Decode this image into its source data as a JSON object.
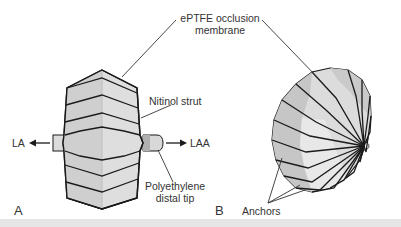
{
  "figure": {
    "panels": [
      {
        "letter": "A",
        "description": "Side view of occlusion device"
      },
      {
        "letter": "B",
        "description": "Oblique view of occlusion device"
      }
    ],
    "labels": {
      "membrane_line1": "ePTFE occlusion",
      "membrane_line2": "membrane",
      "nitinol": "Nitinol strut",
      "tip_line1": "Polyethylene",
      "tip_line2": "distal tip",
      "la": "LA",
      "laa": "LAA",
      "anchors": "Anchors"
    },
    "colors": {
      "fill_light": "#e4e4e4",
      "fill_mid": "#cfcfcf",
      "fill_dark": "#b8b8b8",
      "stroke": "#1a1a1a",
      "footer": "#e6e6e6"
    }
  }
}
